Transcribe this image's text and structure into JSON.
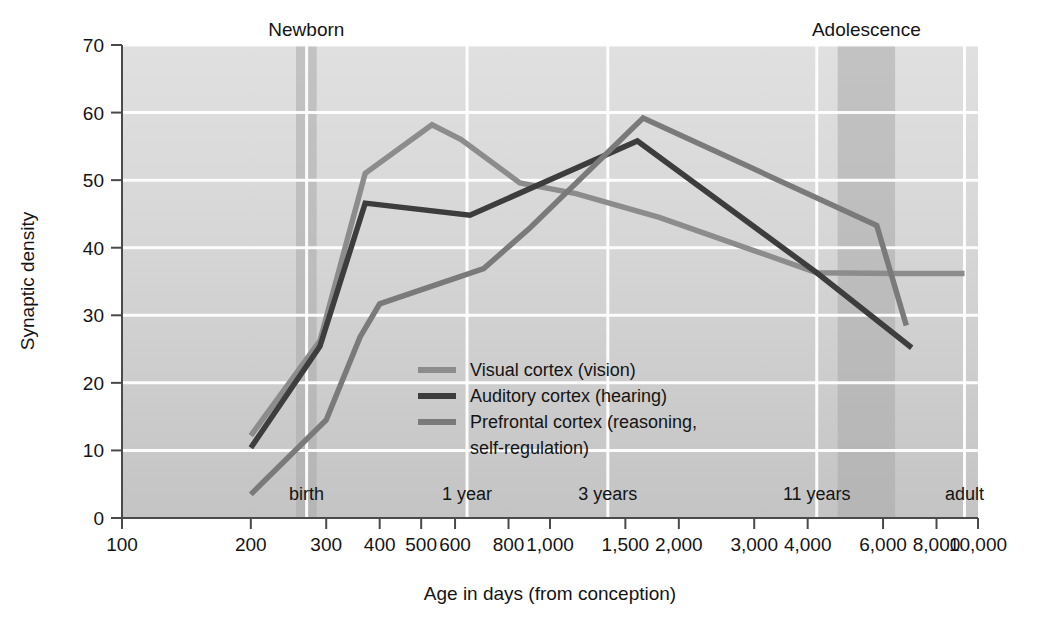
{
  "chart_data": {
    "type": "line",
    "title": "",
    "xlabel": "Age in days (from conception)",
    "ylabel": "Synaptic density",
    "xscale": "log",
    "xlim": [
      100,
      10000
    ],
    "ylim": [
      0,
      70
    ],
    "grid": true,
    "legend_position": "center-left-inside",
    "x_tick_labels": [
      "100",
      "200",
      "300",
      "400",
      "500",
      "600",
      "800",
      "1,000",
      "1,500",
      "2,000",
      "3,000",
      "4,000",
      "6,000",
      "8,000",
      "10,000"
    ],
    "x_tick_values": [
      100,
      200,
      300,
      400,
      500,
      600,
      800,
      1000,
      1500,
      2000,
      3000,
      4000,
      6000,
      8000,
      10000
    ],
    "y_tick_labels": [
      "0",
      "10",
      "20",
      "30",
      "40",
      "50",
      "60",
      "70"
    ],
    "y_tick_values": [
      0,
      10,
      20,
      30,
      40,
      50,
      60,
      70
    ],
    "bands": [
      {
        "label": "Newborn",
        "x_start": 255,
        "x_end": 285,
        "color": "#a9a9a9"
      },
      {
        "label": "Adolescence",
        "x_start": 4700,
        "x_end": 6400,
        "color": "#a9a9a9"
      }
    ],
    "stage_markers": [
      {
        "label": "birth",
        "x": 270
      },
      {
        "label": "1 year",
        "x": 640
      },
      {
        "label": "3 years",
        "x": 1365
      },
      {
        "label": "11 years",
        "x": 4200
      },
      {
        "label": "adult",
        "x": 9300
      }
    ],
    "series": [
      {
        "name": "Visual cortex (vision)",
        "color": "#8c8c8c",
        "points": [
          {
            "x": 200,
            "y": 12.2
          },
          {
            "x": 290,
            "y": 26.2
          },
          {
            "x": 370,
            "y": 51.0
          },
          {
            "x": 530,
            "y": 58.2
          },
          {
            "x": 620,
            "y": 56.0
          },
          {
            "x": 850,
            "y": 49.6
          },
          {
            "x": 1150,
            "y": 48.0
          },
          {
            "x": 1800,
            "y": 44.5
          },
          {
            "x": 4200,
            "y": 36.3
          },
          {
            "x": 6400,
            "y": 36.2
          },
          {
            "x": 9300,
            "y": 36.2
          }
        ]
      },
      {
        "name": "Auditory cortex (hearing)",
        "color": "#3d3d3d",
        "points": [
          {
            "x": 200,
            "y": 10.4
          },
          {
            "x": 290,
            "y": 25.4
          },
          {
            "x": 370,
            "y": 46.6
          },
          {
            "x": 650,
            "y": 44.8
          },
          {
            "x": 1600,
            "y": 55.8
          },
          {
            "x": 4200,
            "y": 36.3
          },
          {
            "x": 7000,
            "y": 25.2
          }
        ]
      },
      {
        "name": "Prefrontal cortex (reasoning, self-regulation)",
        "color": "#7a7a7a",
        "points": [
          {
            "x": 200,
            "y": 3.5
          },
          {
            "x": 300,
            "y": 14.5
          },
          {
            "x": 360,
            "y": 26.8
          },
          {
            "x": 400,
            "y": 31.7
          },
          {
            "x": 700,
            "y": 36.9
          },
          {
            "x": 900,
            "y": 43.0
          },
          {
            "x": 1650,
            "y": 59.2
          },
          {
            "x": 5800,
            "y": 43.3
          },
          {
            "x": 6800,
            "y": 28.5
          }
        ]
      }
    ]
  },
  "legend": {
    "items": [
      {
        "label": "Visual cortex (vision)",
        "color": "#8c8c8c"
      },
      {
        "label": "Auditory cortex (hearing)",
        "color": "#3d3d3d"
      },
      {
        "label": "Prefrontal cortex (reasoning,",
        "color": "#7a7a7a"
      },
      {
        "label": "self-regulation)",
        "color": ""
      }
    ]
  },
  "colors": {
    "plot_background_top": "#dcdcdc",
    "plot_background_bottom": "#c9c9c9",
    "gridline": "#ffffff",
    "axis": "#4a4a4a",
    "band": "#a8a8a8",
    "page_background": "#ffffff"
  }
}
